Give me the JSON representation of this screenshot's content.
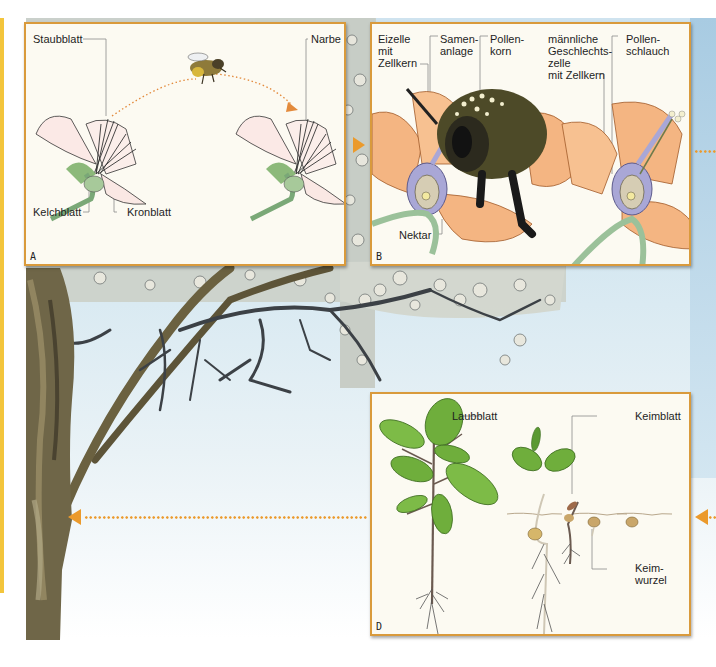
{
  "figure": {
    "colors": {
      "panel_border": "#d99a3c",
      "panel_bg": "#fcfaf2",
      "arrow": "#eb9a2c",
      "sky": "#cfe3ef",
      "petal_orange": "#f4b582",
      "stem_green": "#9bc19a",
      "leaf_green": "#6fae3c",
      "ovary_purple": "#a9a7d6",
      "side_stripe": "#f3c53c"
    },
    "panels": {
      "a": {
        "letter": "A",
        "title": "Bestäubung",
        "labels": {
          "staubblatt": "Staubblatt",
          "narbe": "Narbe",
          "kelchblatt": "Kelchblatt",
          "kronblatt": "Kronblatt"
        },
        "icons": [
          "flower-icon",
          "bee-icon",
          "dotted-arrow-icon"
        ]
      },
      "b": {
        "letter": "B",
        "labels": {
          "eizelle": "Eizelle\nmit\nZellkern",
          "samenanlage": "Samen-\nanlage",
          "pollenkorn": "Pollen-\nkorn",
          "geschlechtszelle": "männliche\nGeschlechts-\nzelle\nmit Zellkern",
          "pollenschlauch": "Pollen-\nschlauch",
          "nektar": "Nektar"
        }
      },
      "d": {
        "letter": "D",
        "labels": {
          "laubblatt": "Laubblatt",
          "keimblatt": "Keimblatt",
          "keimwurzel": "Keim-\nwurzel"
        }
      }
    },
    "connectors": [
      {
        "from": "A",
        "to": "B",
        "style": "arrow-right"
      },
      {
        "from": "B",
        "to": "C",
        "style": "dotted-right"
      },
      {
        "from": "C",
        "to": "D",
        "style": "arrow-left"
      },
      {
        "from": "D",
        "to": "tree",
        "style": "dotted-arrow-left"
      }
    ]
  }
}
